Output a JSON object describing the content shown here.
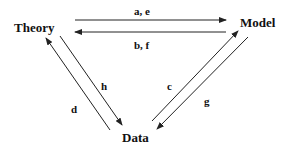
{
  "diagram": {
    "nodes": [
      {
        "id": "theory",
        "label": "Theory"
      },
      {
        "id": "model",
        "label": "Model"
      },
      {
        "id": "data",
        "label": "Data"
      }
    ],
    "edges": [
      {
        "from": "theory",
        "to": "model",
        "label": "a, e"
      },
      {
        "from": "model",
        "to": "theory",
        "label": "b, f"
      },
      {
        "from": "data",
        "to": "model",
        "label": "c"
      },
      {
        "from": "model",
        "to": "data",
        "label": "g"
      },
      {
        "from": "data",
        "to": "theory",
        "label": "d"
      },
      {
        "from": "theory",
        "to": "data",
        "label": "h"
      }
    ],
    "colors": {
      "line": "#222222",
      "text": "#111111",
      "background": "#ffffff"
    }
  }
}
